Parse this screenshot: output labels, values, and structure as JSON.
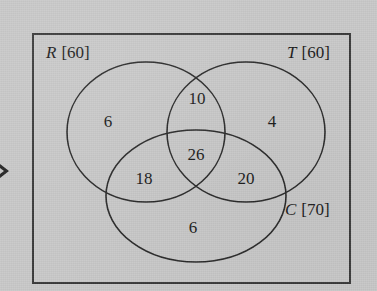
{
  "diagram": {
    "type": "venn-3-set",
    "caption_marker": "▸",
    "background_color": "#c9c9c9",
    "line_color": "#2a2a2a",
    "border_color": "#3a3a3a",
    "universe_box": {
      "x": 33,
      "y": 34,
      "width": 317,
      "height": 249
    },
    "sets": [
      {
        "id": "R",
        "letter": "R",
        "total": "[60]",
        "label": "R [60]",
        "label_x": 46,
        "label_y": 58,
        "cx": 146,
        "cy": 132,
        "rx": 79,
        "ry": 70
      },
      {
        "id": "T",
        "letter": "T",
        "total": "[60]",
        "label": "T [60]",
        "label_x": 287,
        "label_y": 58,
        "cx": 246,
        "cy": 132,
        "rx": 79,
        "ry": 70
      },
      {
        "id": "C",
        "letter": "C",
        "total": "[70]",
        "label": "C [70]",
        "label_x": 285,
        "label_y": 215,
        "cx": 196,
        "cy": 196,
        "rx": 90,
        "ry": 66
      }
    ],
    "regions": [
      {
        "id": "R-only",
        "value": "6",
        "x": 108,
        "y": 127
      },
      {
        "id": "R-and-T",
        "value": "10",
        "x": 197,
        "y": 104
      },
      {
        "id": "T-only",
        "value": "4",
        "x": 272,
        "y": 127
      },
      {
        "id": "R-and-C",
        "value": "18",
        "x": 144,
        "y": 184
      },
      {
        "id": "R-T-C",
        "value": "26",
        "x": 196,
        "y": 160
      },
      {
        "id": "T-and-C",
        "value": "20",
        "x": 246,
        "y": 184
      },
      {
        "id": "C-only",
        "value": "6",
        "x": 193,
        "y": 233
      }
    ]
  }
}
